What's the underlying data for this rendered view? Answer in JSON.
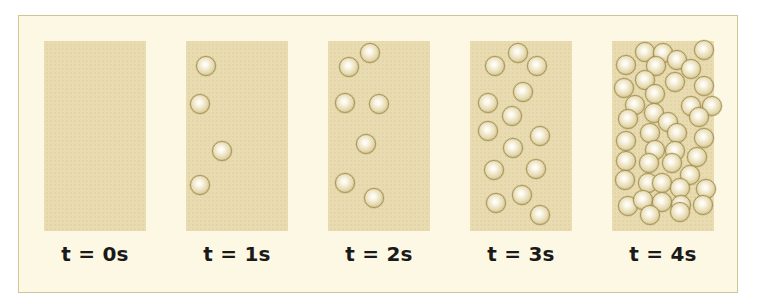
{
  "figure": {
    "colors": {
      "background": "#ffffff",
      "frame_fill": "#fdf8e3",
      "frame_border": "#cfc596",
      "panel_fill": "#e9dbb0",
      "ball_rim": "#a69556"
    },
    "panels": [
      {
        "label": "t = 0s",
        "count": 0,
        "balls": []
      },
      {
        "label": "t = 1s",
        "count": 4,
        "balls": [
          [
            20,
            25
          ],
          [
            14,
            63
          ],
          [
            36,
            110
          ],
          [
            14,
            144
          ]
        ]
      },
      {
        "label": "t = 2s",
        "count": 7,
        "balls": [
          [
            42,
            12
          ],
          [
            21,
            26
          ],
          [
            17,
            62
          ],
          [
            51,
            63
          ],
          [
            38,
            103
          ],
          [
            17,
            142
          ],
          [
            46,
            157
          ]
        ]
      },
      {
        "label": "t = 3s",
        "count": 14,
        "balls": [
          [
            48,
            12
          ],
          [
            25,
            25
          ],
          [
            67,
            25
          ],
          [
            53,
            51
          ],
          [
            18,
            62
          ],
          [
            42,
            75
          ],
          [
            18,
            90
          ],
          [
            70,
            95
          ],
          [
            43,
            107
          ],
          [
            24,
            129
          ],
          [
            66,
            128
          ],
          [
            52,
            154
          ],
          [
            26,
            162
          ],
          [
            70,
            174
          ]
        ]
      },
      {
        "label": "t = 4s",
        "count": 42,
        "balls": [
          [
            33,
            11
          ],
          [
            51,
            12
          ],
          [
            65,
            19
          ],
          [
            92,
            9
          ],
          [
            14,
            24
          ],
          [
            44,
            25
          ],
          [
            79,
            28
          ],
          [
            33,
            39
          ],
          [
            63,
            41
          ],
          [
            92,
            45
          ],
          [
            12,
            47
          ],
          [
            43,
            53
          ],
          [
            23,
            64
          ],
          [
            79,
            65
          ],
          [
            100,
            65
          ],
          [
            42,
            72
          ],
          [
            16,
            78
          ],
          [
            56,
            81
          ],
          [
            87,
            76
          ],
          [
            14,
            100
          ],
          [
            38,
            92
          ],
          [
            65,
            92
          ],
          [
            92,
            97
          ],
          [
            43,
            109
          ],
          [
            63,
            110
          ],
          [
            14,
            120
          ],
          [
            37,
            122
          ],
          [
            60,
            122
          ],
          [
            85,
            116
          ],
          [
            13,
            139
          ],
          [
            36,
            142
          ],
          [
            50,
            142
          ],
          [
            78,
            134
          ],
          [
            68,
            147
          ],
          [
            94,
            148
          ],
          [
            16,
            165
          ],
          [
            31,
            159
          ],
          [
            50,
            161
          ],
          [
            69,
            164
          ],
          [
            91,
            164
          ],
          [
            38,
            174
          ],
          [
            68,
            171
          ]
        ]
      }
    ]
  }
}
